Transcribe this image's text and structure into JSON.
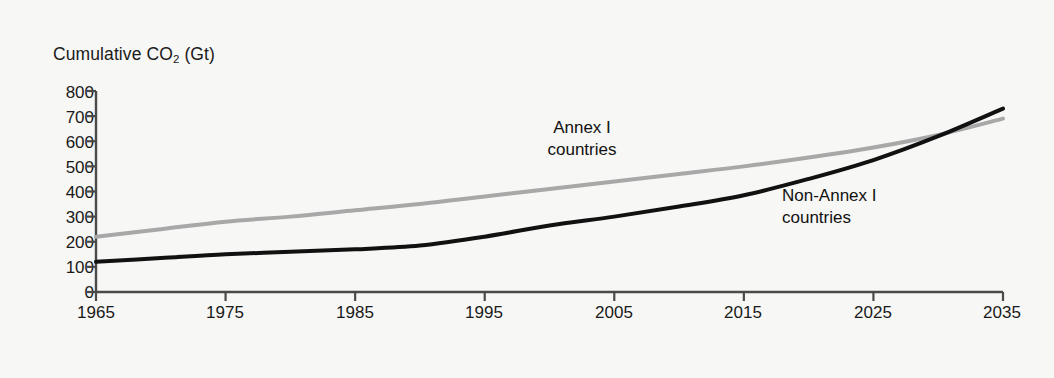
{
  "chart_data": {
    "type": "line",
    "title": "Cumulative CO2 (Gt)",
    "title_prefix": "Cumulative CO",
    "title_sub": "2",
    "title_suffix": " (Gt)",
    "xlabel": "",
    "ylabel": "Cumulative CO2 (Gt)",
    "xlim": [
      1965,
      2035
    ],
    "ylim": [
      0,
      800
    ],
    "grid": false,
    "legend_position": "inline-annotations",
    "xticks": [
      "1965",
      "1975",
      "1985",
      "1995",
      "2005",
      "2015",
      "2025",
      "2035"
    ],
    "xtick_values": [
      1965,
      1975,
      1985,
      1995,
      2005,
      2015,
      2025,
      2035
    ],
    "yticks": [
      "800",
      "700",
      "600",
      "500",
      "400",
      "300",
      "200",
      "100",
      "0"
    ],
    "ytick_values": [
      800,
      700,
      600,
      500,
      400,
      300,
      200,
      100,
      0
    ],
    "x": [
      1965,
      1970,
      1975,
      1980,
      1985,
      1990,
      1995,
      2000,
      2005,
      2010,
      2015,
      2020,
      2025,
      2030,
      2035
    ],
    "series": [
      {
        "name": "Annex I countries",
        "label_line1": "Annex I",
        "label_line2": "countries",
        "color": "#a8a8a8",
        "width": 4,
        "values": [
          220,
          250,
          280,
          300,
          325,
          350,
          380,
          410,
          440,
          470,
          500,
          535,
          575,
          625,
          690
        ]
      },
      {
        "name": "Non-Annex I countries",
        "label_line1": "Non-Annex I",
        "label_line2": "countries",
        "color": "#111111",
        "width": 4,
        "values": [
          120,
          135,
          150,
          160,
          170,
          185,
          220,
          265,
          300,
          340,
          385,
          450,
          525,
          620,
          730
        ]
      }
    ],
    "annotations": [
      {
        "text": "Annex I countries",
        "x": 2000,
        "y": 620
      },
      {
        "text": "Non-Annex I countries",
        "x": 2022,
        "y": 415
      }
    ]
  },
  "axes": {
    "axis_color": "#4a4a4a",
    "background": "#f7f7f5"
  }
}
